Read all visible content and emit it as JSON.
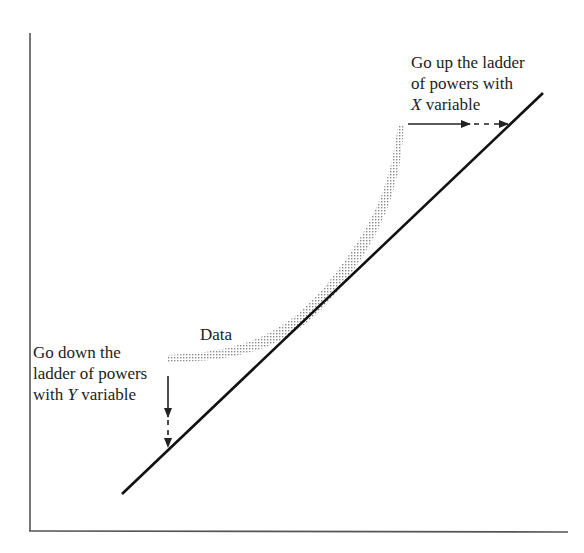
{
  "diagram": {
    "title": "",
    "colors": {
      "axis": "#555555",
      "line": "#111111",
      "data": "#9a9a9a",
      "text": "#222222"
    },
    "data_label": "Data",
    "up_label": {
      "line1": "Go up the ladder",
      "line2": "of powers with",
      "var": "X",
      "rest": " variable"
    },
    "down_label": {
      "line1": "Go down the",
      "line2": "ladder of powers",
      "prefix": "with ",
      "var": "Y",
      "rest": " variable"
    }
  }
}
